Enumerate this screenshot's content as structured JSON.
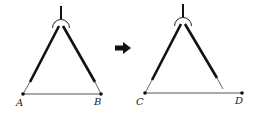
{
  "diagram": {
    "left_figure": {
      "points": [
        {
          "label": "A",
          "x": 23,
          "y": 94
        },
        {
          "label": "B",
          "x": 101,
          "y": 94
        }
      ]
    },
    "arrow": {
      "direction": "right"
    },
    "right_figure": {
      "points": [
        {
          "label": "C",
          "x": 145,
          "y": 93
        },
        {
          "label": "D",
          "x": 242,
          "y": 93
        }
      ]
    },
    "colors": {
      "ink": "#111111",
      "segment": "#555555"
    }
  }
}
